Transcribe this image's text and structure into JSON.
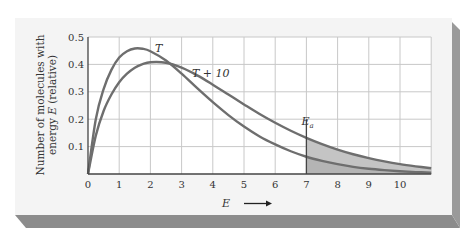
{
  "chart_data": {
    "type": "line",
    "title": "",
    "xlabel": "E",
    "ylabel_line1": "Number of molecules with",
    "ylabel_line2": "energy E (relative)",
    "xlim": [
      0,
      11
    ],
    "ylim": [
      0,
      0.5
    ],
    "x_ticks": [
      0,
      1,
      2,
      3,
      4,
      5,
      6,
      7,
      8,
      9,
      10
    ],
    "y_ticks": [
      0.1,
      0.2,
      0.3,
      0.4,
      0.5
    ],
    "y_tick_labels": [
      "0.1",
      "0.2",
      "0.3",
      "0.4",
      "0.5"
    ],
    "grid": true,
    "series": [
      {
        "name": "T",
        "peak_x": 1.6,
        "peak_y": 0.46,
        "x": [
          0,
          0.25,
          0.5,
          0.75,
          1,
          1.25,
          1.5,
          1.75,
          2,
          2.5,
          3,
          3.5,
          4,
          4.5,
          5,
          5.5,
          6,
          6.5,
          7,
          7.5,
          8,
          8.5,
          9,
          9.5,
          10,
          10.5,
          11
        ],
        "values": [
          0,
          0.2,
          0.31,
          0.38,
          0.425,
          0.448,
          0.458,
          0.457,
          0.448,
          0.414,
          0.366,
          0.313,
          0.262,
          0.215,
          0.173,
          0.137,
          0.108,
          0.083,
          0.063,
          0.048,
          0.036,
          0.026,
          0.019,
          0.014,
          0.01,
          0.007,
          0.005
        ]
      },
      {
        "name": "T + 10",
        "peak_x": 2.1,
        "peak_y": 0.41,
        "x": [
          0,
          0.25,
          0.5,
          0.75,
          1,
          1.25,
          1.5,
          1.75,
          2,
          2.5,
          3,
          3.5,
          4,
          4.5,
          5,
          5.5,
          6,
          6.5,
          7,
          7.5,
          8,
          8.5,
          9,
          9.5,
          10,
          10.5,
          11
        ],
        "values": [
          0,
          0.14,
          0.23,
          0.29,
          0.335,
          0.366,
          0.388,
          0.401,
          0.408,
          0.406,
          0.388,
          0.36,
          0.326,
          0.29,
          0.254,
          0.219,
          0.187,
          0.158,
          0.132,
          0.109,
          0.089,
          0.072,
          0.058,
          0.046,
          0.036,
          0.028,
          0.021
        ]
      }
    ],
    "annotations": [
      {
        "text": "T",
        "x": 2.3,
        "y": 0.465
      },
      {
        "text": "T + 10",
        "x": 3.3,
        "y": 0.385
      },
      {
        "text": "Ea",
        "x": 7.0,
        "y": 0.155,
        "type": "vertical-line",
        "shaded_region": "E >= 7 under both curves"
      }
    ],
    "legend": "none (curve labels inline)"
  },
  "labels": {
    "curve_T": "T",
    "curve_T10": "T + 10",
    "ea": "E",
    "ea_sub": "a",
    "xlabel": "E",
    "ylabel_line1": "Number of molecules with",
    "ylabel_line2": "energy E (relative)"
  },
  "colors": {
    "curve": "#6e6e6e",
    "grid": "#c8c8c8",
    "shade": "#c4c4c4",
    "card": "#f4f4f4",
    "shadow": "#8c8c8c",
    "axis": "#444444",
    "text": "#333333"
  }
}
